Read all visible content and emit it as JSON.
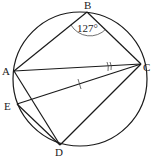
{
  "diagram": {
    "type": "circle-geometry",
    "circle": {
      "cx": 80,
      "cy": 79,
      "r": 67
    },
    "points": {
      "A": {
        "label": "A",
        "x": 14,
        "y": 71
      },
      "B": {
        "label": "B",
        "x": 87,
        "y": 12
      },
      "C": {
        "label": "C",
        "x": 141,
        "y": 64
      },
      "D": {
        "label": "D",
        "x": 60,
        "y": 145
      },
      "E": {
        "label": "E",
        "x": 17,
        "y": 104
      }
    },
    "segments": [
      "AB",
      "BC",
      "AC",
      "EC",
      "AD",
      "ED",
      "DC"
    ],
    "angle_label": "127°",
    "angle_vertex": "B",
    "marks": {
      "tick_on": "EC",
      "double_arc_at": "C"
    }
  }
}
